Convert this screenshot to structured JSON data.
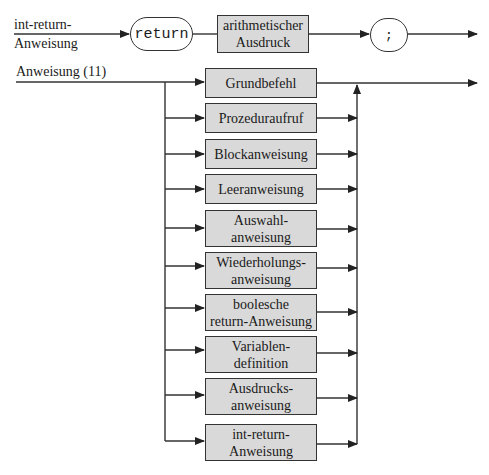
{
  "rule1": {
    "label_line1": "int-return-",
    "label_line2": "Anweisung",
    "terminal_return": "return",
    "nonterminal_line1": "arithmetischer",
    "nonterminal_line2": "Ausdruck",
    "terminal_semicolon": ";"
  },
  "rule2": {
    "label": "Anweisung (11)",
    "alternatives": [
      {
        "line1": "Grundbefehl",
        "line2": ""
      },
      {
        "line1": "Prozeduraufruf",
        "line2": ""
      },
      {
        "line1": "Blockanweisung",
        "line2": ""
      },
      {
        "line1": "Leeranweisung",
        "line2": ""
      },
      {
        "line1": "Auswahl-",
        "line2": "anweisung"
      },
      {
        "line1": "Wiederholungs-",
        "line2": "anweisung"
      },
      {
        "line1": "boolesche",
        "line2": "return-Anweisung"
      },
      {
        "line1": "Variablen-",
        "line2": "definition"
      },
      {
        "line1": "Ausdrucks-",
        "line2": "anweisung"
      },
      {
        "line1": "int-return-",
        "line2": "Anweisung"
      }
    ]
  },
  "colors": {
    "box_fill": "#d9d9d9",
    "line": "#333333"
  }
}
